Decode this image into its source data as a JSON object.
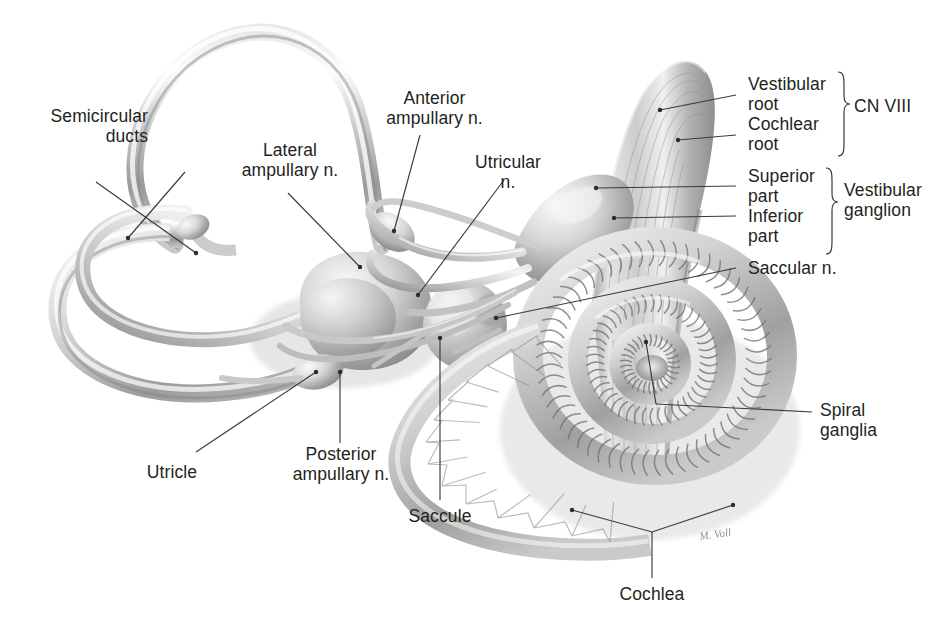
{
  "figure": {
    "kind": "anatomical-illustration",
    "background_color": "#ffffff",
    "ink_color": "#231f20",
    "leader_color": "#3a3a3a",
    "signature": "M. Voll"
  },
  "labels": {
    "semicircular_ducts": "Semicircular\nducts",
    "lateral_ampullary": "Lateral\nampullary n.",
    "anterior_ampullary": "Anterior\nampullary n.",
    "utricular": "Utricular\nn.",
    "vestibular_root": "Vestibular\nroot",
    "cochlear_root": "Cochlear\nroot",
    "superior_part": "Superior\npart",
    "inferior_part": "Inferior\npart",
    "cn_viii": "CN VIII",
    "vestibular_ganglion": "Vestibular\nganglion",
    "saccular": "Saccular n.",
    "spiral_ganglia": "Spiral\nganglia",
    "utricle": "Utricle",
    "posterior_ampullary": "Posterior\nampullary n.",
    "saccule": "Saccule",
    "cochlea": "Cochlea"
  },
  "braces": {
    "cn_viii_groups": [
      "Vestibular root",
      "Cochlear root"
    ],
    "vestibular_ganglion_groups": [
      "Superior part",
      "Inferior part"
    ]
  },
  "structures": [
    "anterior semicircular duct",
    "lateral semicircular duct",
    "posterior semicircular duct",
    "utricle",
    "saccule",
    "cochlea",
    "vestibulocochlear nerve trunk",
    "vestibular ganglion",
    "spiral ganglia"
  ]
}
